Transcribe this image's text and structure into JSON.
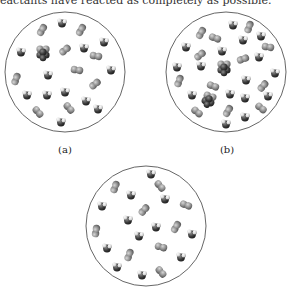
{
  "caption_fragment": "eactants have reacted as completely as possible.",
  "panels": [
    {
      "id": "a",
      "label": "(a)",
      "circle": {
        "cx": 65,
        "cy": 72,
        "r": 60
      },
      "molecules": [
        {
          "type": "diatomic",
          "x": 42,
          "y": 30,
          "angle": -60
        },
        {
          "type": "bent",
          "x": 62,
          "y": 23,
          "angle": 0
        },
        {
          "type": "diatomic",
          "x": 81,
          "y": 30,
          "angle": -60
        },
        {
          "type": "bent",
          "x": 104,
          "y": 42,
          "angle": 0
        },
        {
          "type": "bent",
          "x": 21,
          "y": 52,
          "angle": 0
        },
        {
          "type": "cluster",
          "x": 43,
          "y": 52,
          "angle": 0
        },
        {
          "type": "diatomic",
          "x": 65,
          "y": 50,
          "angle": -40
        },
        {
          "type": "bent",
          "x": 84,
          "y": 48,
          "angle": 0
        },
        {
          "type": "diatomic",
          "x": 96,
          "y": 56,
          "angle": 10
        },
        {
          "type": "bent",
          "x": 48,
          "y": 75,
          "angle": 0
        },
        {
          "type": "diatomic",
          "x": 77,
          "y": 70,
          "angle": 10
        },
        {
          "type": "bent",
          "x": 111,
          "y": 70,
          "angle": 0
        },
        {
          "type": "diatomic",
          "x": 16,
          "y": 79,
          "angle": -70
        },
        {
          "type": "diatomic",
          "x": 95,
          "y": 84,
          "angle": -40
        },
        {
          "type": "bent",
          "x": 27,
          "y": 95,
          "angle": 0
        },
        {
          "type": "bent",
          "x": 47,
          "y": 95,
          "angle": 0
        },
        {
          "type": "bent",
          "x": 65,
          "y": 92,
          "angle": 0
        },
        {
          "type": "bent",
          "x": 86,
          "y": 101,
          "angle": 0
        },
        {
          "type": "diatomic",
          "x": 69,
          "y": 108,
          "angle": 50
        },
        {
          "type": "diatomic",
          "x": 38,
          "y": 112,
          "angle": 50
        },
        {
          "type": "bent",
          "x": 98,
          "y": 109,
          "angle": 0
        },
        {
          "type": "bent",
          "x": 61,
          "y": 122,
          "angle": 0
        }
      ]
    },
    {
      "id": "b",
      "label": "(b)",
      "circle": {
        "cx": 226,
        "cy": 72,
        "r": 60
      },
      "molecules": [
        {
          "type": "bent",
          "x": 233,
          "y": 25,
          "angle": 0
        },
        {
          "type": "diatomic",
          "x": 249,
          "y": 27,
          "angle": -70
        },
        {
          "type": "diatomic",
          "x": 201,
          "y": 33,
          "angle": -60
        },
        {
          "type": "diatomic",
          "x": 215,
          "y": 38,
          "angle": 20
        },
        {
          "type": "bent",
          "x": 243,
          "y": 40,
          "angle": 0
        },
        {
          "type": "bent",
          "x": 261,
          "y": 36,
          "angle": 0
        },
        {
          "type": "diatomic",
          "x": 268,
          "y": 47,
          "angle": 10
        },
        {
          "type": "bent",
          "x": 186,
          "y": 47,
          "angle": 0
        },
        {
          "type": "diatomic",
          "x": 200,
          "y": 55,
          "angle": -40
        },
        {
          "type": "bent",
          "x": 222,
          "y": 51,
          "angle": 0
        },
        {
          "type": "diatomic",
          "x": 243,
          "y": 59,
          "angle": -20
        },
        {
          "type": "bent",
          "x": 259,
          "y": 57,
          "angle": 0
        },
        {
          "type": "bent",
          "x": 177,
          "y": 67,
          "angle": 0
        },
        {
          "type": "bent",
          "x": 201,
          "y": 66,
          "angle": 0
        },
        {
          "type": "cluster",
          "x": 224,
          "y": 67,
          "angle": 0
        },
        {
          "type": "bent",
          "x": 275,
          "y": 73,
          "angle": 0
        },
        {
          "type": "diatomic",
          "x": 179,
          "y": 81,
          "angle": -70
        },
        {
          "type": "bent",
          "x": 246,
          "y": 80,
          "angle": 0
        },
        {
          "type": "diatomic",
          "x": 213,
          "y": 86,
          "angle": 20
        },
        {
          "type": "diatomic",
          "x": 263,
          "y": 86,
          "angle": -50
        },
        {
          "type": "bent",
          "x": 192,
          "y": 95,
          "angle": 0
        },
        {
          "type": "cluster",
          "x": 209,
          "y": 99,
          "angle": 20
        },
        {
          "type": "bent",
          "x": 230,
          "y": 94,
          "angle": 0
        },
        {
          "type": "bent",
          "x": 245,
          "y": 98,
          "angle": 0
        },
        {
          "type": "bent",
          "x": 268,
          "y": 96,
          "angle": 0
        },
        {
          "type": "diatomic",
          "x": 197,
          "y": 112,
          "angle": 40
        },
        {
          "type": "diatomic",
          "x": 228,
          "y": 111,
          "angle": -60
        },
        {
          "type": "bent",
          "x": 245,
          "y": 117,
          "angle": 0
        },
        {
          "type": "diatomic",
          "x": 261,
          "y": 108,
          "angle": 40
        },
        {
          "type": "bent",
          "x": 226,
          "y": 124,
          "angle": 0
        }
      ]
    },
    {
      "id": "c",
      "label": "",
      "circle": {
        "cx": 146,
        "cy": 226,
        "r": 60
      },
      "molecules": [
        {
          "type": "bent",
          "x": 151,
          "y": 174,
          "angle": 0
        },
        {
          "type": "diatomic",
          "x": 115,
          "y": 187,
          "angle": -70
        },
        {
          "type": "diatomic",
          "x": 160,
          "y": 186,
          "angle": 50
        },
        {
          "type": "bent",
          "x": 131,
          "y": 195,
          "angle": 0
        },
        {
          "type": "bent",
          "x": 165,
          "y": 199,
          "angle": 0
        },
        {
          "type": "diatomic",
          "x": 186,
          "y": 205,
          "angle": 20
        },
        {
          "type": "bent",
          "x": 102,
          "y": 206,
          "angle": 0
        },
        {
          "type": "diatomic",
          "x": 144,
          "y": 210,
          "angle": -50
        },
        {
          "type": "bent",
          "x": 128,
          "y": 220,
          "angle": 0
        },
        {
          "type": "diatomic",
          "x": 96,
          "y": 231,
          "angle": -80
        },
        {
          "type": "bent",
          "x": 156,
          "y": 227,
          "angle": 0
        },
        {
          "type": "diatomic",
          "x": 176,
          "y": 227,
          "angle": -60
        },
        {
          "type": "bent",
          "x": 192,
          "y": 234,
          "angle": 0
        },
        {
          "type": "bent",
          "x": 139,
          "y": 236,
          "angle": 0
        },
        {
          "type": "bent",
          "x": 107,
          "y": 248,
          "angle": 0
        },
        {
          "type": "diatomic",
          "x": 161,
          "y": 247,
          "angle": 15
        },
        {
          "type": "diatomic",
          "x": 129,
          "y": 255,
          "angle": -70
        },
        {
          "type": "bent",
          "x": 181,
          "y": 257,
          "angle": 0
        },
        {
          "type": "bent",
          "x": 117,
          "y": 267,
          "angle": 0
        },
        {
          "type": "bent",
          "x": 142,
          "y": 275,
          "angle": 0
        },
        {
          "type": "diatomic",
          "x": 161,
          "y": 272,
          "angle": 50
        }
      ]
    }
  ],
  "colors": {
    "circle_stroke": "#555555",
    "atom_light": "#9a9a9a",
    "atom_dark": "#3c3c3c",
    "atom_white": "#e6e6e6"
  }
}
